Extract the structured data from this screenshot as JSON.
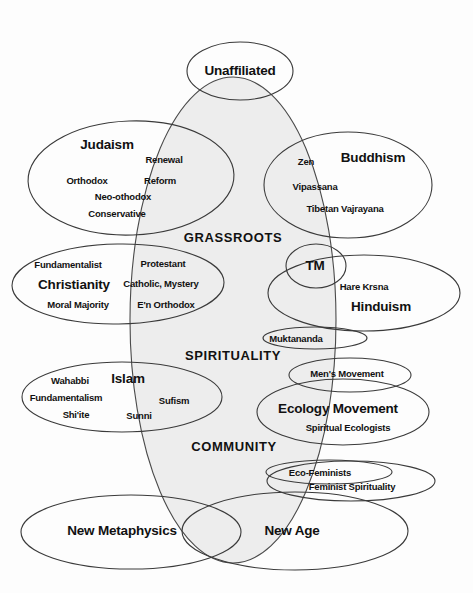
{
  "diagram": {
    "type": "venn-overlap-diagram",
    "background_color": "#fdfdfd",
    "stroke_color": "#3a3a3a",
    "shaded_fill_color": "#ececec",
    "text_color": "#111111",
    "center_axis_labels": [
      {
        "text": "GRASSROOTS",
        "x": 233,
        "y": 237
      },
      {
        "text": "SPIRITUALITY",
        "x": 233,
        "y": 355
      },
      {
        "text": "COMMUNITY",
        "x": 234,
        "y": 446
      }
    ],
    "groups": [
      {
        "name": "unaffiliated",
        "major_label": {
          "text": "Unaffiliated",
          "x": 240,
          "y": 70
        },
        "minor_labels": []
      },
      {
        "name": "judaism",
        "major_label": {
          "text": "Judaism",
          "x": 107,
          "y": 144
        },
        "minor_labels": [
          {
            "text": "Renewal",
            "x": 164,
            "y": 159
          },
          {
            "text": "Orthodox",
            "x": 87,
            "y": 180
          },
          {
            "text": "Reform",
            "x": 160,
            "y": 180
          },
          {
            "text": "Neo-othodox",
            "x": 123,
            "y": 196
          },
          {
            "text": "Conservative",
            "x": 117,
            "y": 213
          }
        ]
      },
      {
        "name": "buddhism",
        "major_label": {
          "text": "Buddhism",
          "x": 373,
          "y": 157
        },
        "minor_labels": [
          {
            "text": "Zen",
            "x": 306,
            "y": 161
          },
          {
            "text": "Vipassana",
            "x": 315,
            "y": 186
          },
          {
            "text": "Tibetan Vajrayana",
            "x": 345,
            "y": 208
          }
        ]
      },
      {
        "name": "christianity",
        "major_label": {
          "text": "Christianity",
          "x": 74,
          "y": 284
        },
        "minor_labels": [
          {
            "text": "Fundamentalist",
            "x": 68,
            "y": 264
          },
          {
            "text": "Protestant",
            "x": 163,
            "y": 263
          },
          {
            "text": "Catholic, Mystery",
            "x": 161,
            "y": 283
          },
          {
            "text": "Moral Majority",
            "x": 78,
            "y": 304
          },
          {
            "text": "E'n Orthodox",
            "x": 166,
            "y": 304
          }
        ]
      },
      {
        "name": "tm",
        "major_label": {
          "text": "TM",
          "x": 315,
          "y": 265
        },
        "minor_labels": []
      },
      {
        "name": "hinduism",
        "major_label": {
          "text": "Hinduism",
          "x": 381,
          "y": 306
        },
        "minor_labels": [
          {
            "text": "Hare Krsna",
            "x": 364,
            "y": 286
          }
        ]
      },
      {
        "name": "muktananda",
        "major_label": null,
        "minor_labels": [
          {
            "text": "Muktananda",
            "x": 296,
            "y": 338
          }
        ]
      },
      {
        "name": "islam",
        "major_label": {
          "text": "Islam",
          "x": 128,
          "y": 378
        },
        "minor_labels": [
          {
            "text": "Wahabbi",
            "x": 70,
            "y": 380
          },
          {
            "text": "Fundamentalism",
            "x": 66,
            "y": 397
          },
          {
            "text": "Sufism",
            "x": 174,
            "y": 400
          },
          {
            "text": "Shi'ite",
            "x": 76,
            "y": 414
          },
          {
            "text": "Sunni",
            "x": 139,
            "y": 415
          }
        ]
      },
      {
        "name": "mens-movement",
        "major_label": null,
        "minor_labels": [
          {
            "text": "Men's Movement",
            "x": 347,
            "y": 373
          }
        ]
      },
      {
        "name": "ecology-movement",
        "major_label": {
          "text": "Ecology Movement",
          "x": 338,
          "y": 408
        },
        "minor_labels": [
          {
            "text": "Spiritual Ecologists",
            "x": 348,
            "y": 427
          }
        ]
      },
      {
        "name": "eco-feminists",
        "major_label": null,
        "minor_labels": [
          {
            "text": "Eco-Feminists",
            "x": 320,
            "y": 472
          },
          {
            "text": "Feminist Spirituality",
            "x": 352,
            "y": 486
          }
        ]
      },
      {
        "name": "new-metaphysics",
        "major_label": {
          "text": "New Metaphysics",
          "x": 122,
          "y": 530
        },
        "minor_labels": []
      },
      {
        "name": "new-age",
        "major_label": {
          "text": "New Age",
          "x": 292,
          "y": 530
        },
        "minor_labels": []
      }
    ],
    "shapes": {
      "center_shaded": {
        "cx": 233,
        "cy": 320,
        "rx": 103,
        "ry": 243,
        "rot": 0
      },
      "unaffiliated": {
        "cx": 240,
        "cy": 71,
        "rx": 53,
        "ry": 29,
        "rot": 0
      },
      "judaism": {
        "cx": 131,
        "cy": 178,
        "rx": 103,
        "ry": 57,
        "rot": -2
      },
      "buddhism": {
        "cx": 348,
        "cy": 185,
        "rx": 84,
        "ry": 53,
        "rot": 0
      },
      "christianity": {
        "cx": 118,
        "cy": 284,
        "rx": 106,
        "ry": 40,
        "rot": -1
      },
      "tm": {
        "cx": 316,
        "cy": 266,
        "rx": 30,
        "ry": 22,
        "rot": 0
      },
      "hinduism": {
        "cx": 364,
        "cy": 293,
        "rx": 96,
        "ry": 38,
        "rot": 0
      },
      "muktananda": {
        "cx": 315,
        "cy": 338,
        "rx": 52,
        "ry": 11,
        "rot": 0
      },
      "islam": {
        "cx": 122,
        "cy": 397,
        "rx": 100,
        "ry": 35,
        "rot": 0
      },
      "mens_movement": {
        "cx": 350,
        "cy": 375,
        "rx": 61,
        "ry": 17,
        "rot": 0
      },
      "ecology": {
        "cx": 343,
        "cy": 412,
        "rx": 86,
        "ry": 33,
        "rot": 0
      },
      "ecofem_inner": {
        "cx": 329,
        "cy": 472,
        "rx": 63,
        "ry": 12,
        "rot": 0
      },
      "ecofem_outer": {
        "cx": 351,
        "cy": 481,
        "rx": 84,
        "ry": 20,
        "rot": 0
      },
      "new_metaphys": {
        "cx": 131,
        "cy": 532,
        "rx": 110,
        "ry": 37,
        "rot": 0
      },
      "new_age": {
        "cx": 295,
        "cy": 531,
        "rx": 113,
        "ry": 39,
        "rot": 0
      }
    }
  }
}
